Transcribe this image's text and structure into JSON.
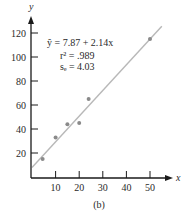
{
  "chart_data": {
    "type": "scatter",
    "title": "",
    "caption": "(b)",
    "xlabel": "x",
    "ylabel": "y",
    "xlim": [
      0,
      57
    ],
    "ylim": [
      0,
      135
    ],
    "x_ticks": [
      10,
      20,
      30,
      40,
      50
    ],
    "y_ticks": [
      20,
      40,
      60,
      80,
      100,
      120
    ],
    "x_tick_labels": [
      "10",
      "20",
      "30",
      "40",
      "50"
    ],
    "y_tick_labels": [
      "20",
      "40",
      "60",
      "80",
      "100",
      "120"
    ],
    "grid": false,
    "series": [
      {
        "name": "observations",
        "type": "scatter",
        "x": [
          4.5,
          10,
          15,
          20,
          24,
          50
        ],
        "y": [
          15,
          33,
          44,
          45,
          65,
          115
        ]
      },
      {
        "name": "fitted line",
        "type": "line",
        "intercept": 7.87,
        "slope": 2.14,
        "x_range": [
          0,
          55
        ]
      }
    ],
    "annotations": {
      "equation": "ŷ = 7.87 + 2.14x",
      "r_squared": "r² = .989",
      "se": "sₑ = 4.03"
    },
    "colors": {
      "axis": "#1a1a1a",
      "line": "#b8b8b8",
      "points": "#8a8a8a",
      "text": "#2a2a2a"
    }
  }
}
